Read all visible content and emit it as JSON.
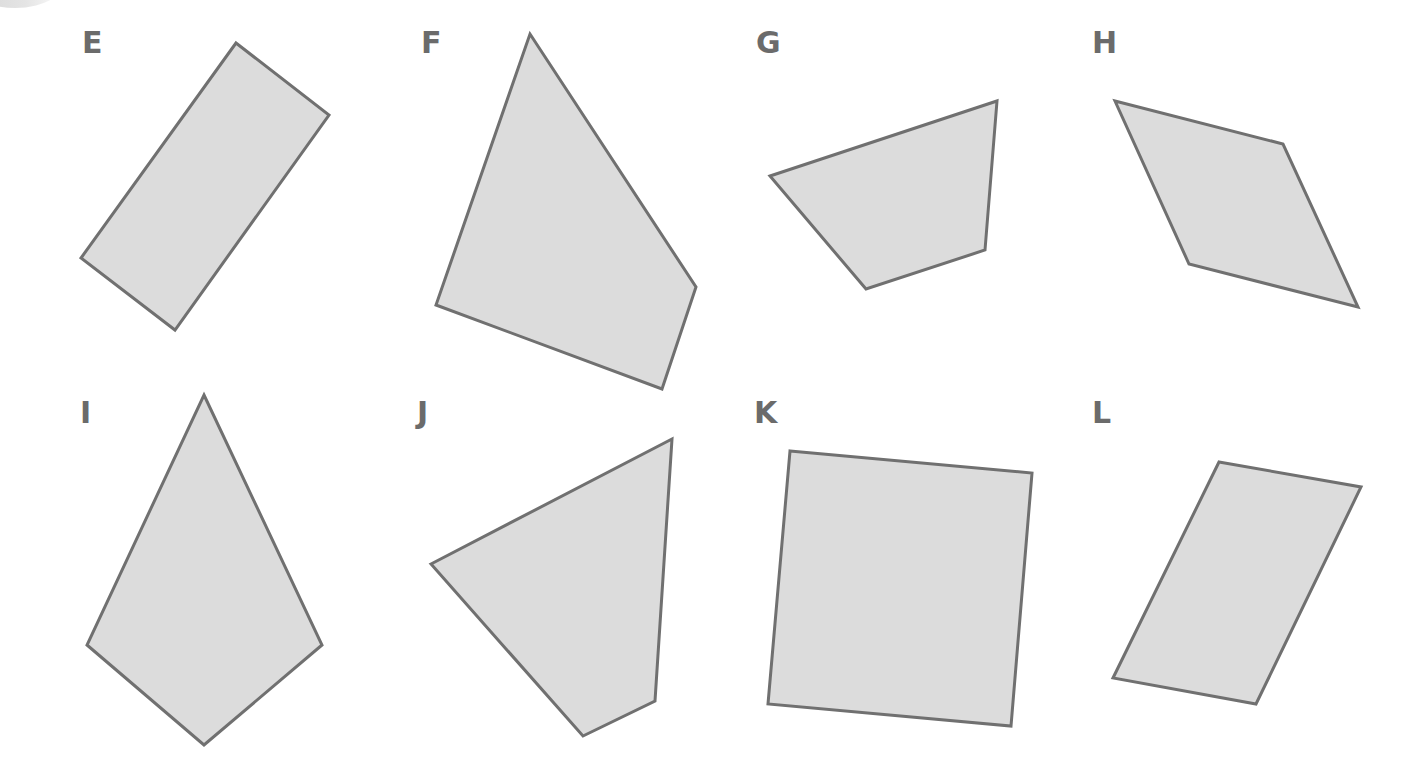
{
  "figure": {
    "fill_color": "#dcdcdc",
    "stroke_color": "#707070",
    "label_color": "#6b6b6b",
    "stroke_width": 3
  },
  "shapes": [
    {
      "label": "E",
      "label_pos": [
        82,
        28
      ],
      "points": [
        [
          236,
          43
        ],
        [
          329,
          115
        ],
        [
          175,
          330
        ],
        [
          81,
          258
        ]
      ]
    },
    {
      "label": "F",
      "label_pos": [
        421,
        28
      ],
      "points": [
        [
          530,
          34
        ],
        [
          696,
          287
        ],
        [
          662,
          389
        ],
        [
          436,
          305
        ]
      ]
    },
    {
      "label": "G",
      "label_pos": [
        756,
        28
      ],
      "points": [
        [
          770,
          176
        ],
        [
          997,
          101
        ],
        [
          985,
          250
        ],
        [
          866,
          289
        ]
      ]
    },
    {
      "label": "H",
      "label_pos": [
        1092,
        28
      ],
      "points": [
        [
          1115,
          101
        ],
        [
          1283,
          144
        ],
        [
          1358,
          307
        ],
        [
          1189,
          264
        ]
      ]
    },
    {
      "label": "I",
      "label_pos": [
        80,
        398
      ],
      "points": [
        [
          204,
          395
        ],
        [
          322,
          645
        ],
        [
          204,
          745
        ],
        [
          87,
          645
        ]
      ]
    },
    {
      "label": "J",
      "label_pos": [
        417,
        398
      ],
      "points": [
        [
          431,
          564
        ],
        [
          672,
          439
        ],
        [
          655,
          701
        ],
        [
          583,
          736
        ]
      ]
    },
    {
      "label": "K",
      "label_pos": [
        754,
        398
      ],
      "points": [
        [
          790,
          451
        ],
        [
          1032,
          473
        ],
        [
          1011,
          726
        ],
        [
          768,
          704
        ]
      ]
    },
    {
      "label": "L",
      "label_pos": [
        1092,
        398
      ],
      "points": [
        [
          1219,
          462
        ],
        [
          1361,
          487
        ],
        [
          1256,
          704
        ],
        [
          1113,
          678
        ]
      ]
    }
  ]
}
